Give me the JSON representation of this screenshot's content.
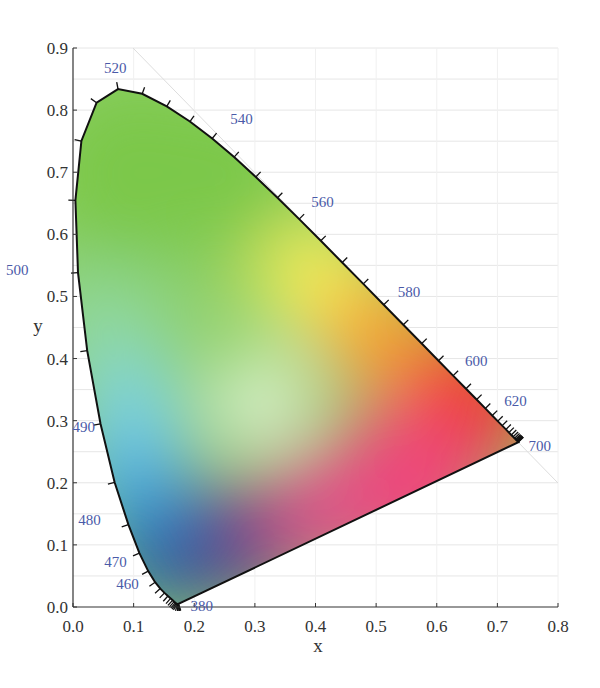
{
  "chart_data": {
    "type": "scatter",
    "title": "",
    "subtitle": "",
    "xlabel": "x",
    "ylabel": "y",
    "xlim": [
      0.0,
      0.8
    ],
    "ylim": [
      0.0,
      0.9
    ],
    "x_ticks": [
      "0.0",
      "0.1",
      "0.2",
      "0.3",
      "0.4",
      "0.5",
      "0.6",
      "0.7",
      "0.8"
    ],
    "y_ticks": [
      "0.0",
      "0.1",
      "0.2",
      "0.3",
      "0.4",
      "0.5",
      "0.6",
      "0.7",
      "0.8",
      "0.9"
    ],
    "grid": true,
    "legend": "none",
    "wavelength_labels": [
      {
        "nm": "380",
        "x": 0.1741,
        "y": 0.005
      },
      {
        "nm": "460",
        "x": 0.144,
        "y": 0.0297
      },
      {
        "nm": "470",
        "x": 0.1241,
        "y": 0.0578
      },
      {
        "nm": "480",
        "x": 0.0913,
        "y": 0.1327
      },
      {
        "nm": "490",
        "x": 0.0454,
        "y": 0.295
      },
      {
        "nm": "500",
        "x": 0.0082,
        "y": 0.5384
      },
      {
        "nm": "520",
        "x": 0.0743,
        "y": 0.8338
      },
      {
        "nm": "540",
        "x": 0.2296,
        "y": 0.7543
      },
      {
        "nm": "560",
        "x": 0.3731,
        "y": 0.6245
      },
      {
        "nm": "580",
        "x": 0.5125,
        "y": 0.4866
      },
      {
        "nm": "600",
        "x": 0.627,
        "y": 0.3725
      },
      {
        "nm": "620",
        "x": 0.6915,
        "y": 0.3083
      },
      {
        "nm": "700",
        "x": 0.7347,
        "y": 0.2653
      }
    ],
    "spectral_locus": [
      [
        0.1741,
        0.005
      ],
      [
        0.174,
        0.005
      ],
      [
        0.1738,
        0.0049
      ],
      [
        0.1736,
        0.0049
      ],
      [
        0.1733,
        0.0048
      ],
      [
        0.173,
        0.0048
      ],
      [
        0.1726,
        0.0048
      ],
      [
        0.1721,
        0.0048
      ],
      [
        0.1714,
        0.0051
      ],
      [
        0.1703,
        0.0058
      ],
      [
        0.1689,
        0.0069
      ],
      [
        0.1669,
        0.0086
      ],
      [
        0.1644,
        0.0109
      ],
      [
        0.1611,
        0.0138
      ],
      [
        0.1566,
        0.0177
      ],
      [
        0.151,
        0.0227
      ],
      [
        0.144,
        0.0297
      ],
      [
        0.1355,
        0.0399
      ],
      [
        0.1241,
        0.0578
      ],
      [
        0.1096,
        0.0868
      ],
      [
        0.0913,
        0.1327
      ],
      [
        0.0687,
        0.2007
      ],
      [
        0.0454,
        0.295
      ],
      [
        0.0235,
        0.4127
      ],
      [
        0.0082,
        0.5384
      ],
      [
        0.0039,
        0.6548
      ],
      [
        0.0139,
        0.7502
      ],
      [
        0.0389,
        0.812
      ],
      [
        0.0743,
        0.8338
      ],
      [
        0.1142,
        0.8262
      ],
      [
        0.1547,
        0.8059
      ],
      [
        0.1929,
        0.7816
      ],
      [
        0.2296,
        0.7543
      ],
      [
        0.2658,
        0.7243
      ],
      [
        0.3016,
        0.6923
      ],
      [
        0.3373,
        0.6589
      ],
      [
        0.3731,
        0.6245
      ],
      [
        0.4087,
        0.5896
      ],
      [
        0.4441,
        0.5547
      ],
      [
        0.4788,
        0.5202
      ],
      [
        0.5125,
        0.4866
      ],
      [
        0.5448,
        0.4544
      ],
      [
        0.5752,
        0.4242
      ],
      [
        0.6029,
        0.3965
      ],
      [
        0.627,
        0.3725
      ],
      [
        0.6482,
        0.3514
      ],
      [
        0.6658,
        0.334
      ],
      [
        0.6801,
        0.3197
      ],
      [
        0.6915,
        0.3083
      ],
      [
        0.7006,
        0.2993
      ],
      [
        0.7079,
        0.292
      ],
      [
        0.714,
        0.2859
      ],
      [
        0.719,
        0.2809
      ],
      [
        0.723,
        0.277
      ],
      [
        0.726,
        0.274
      ],
      [
        0.7283,
        0.2717
      ],
      [
        0.73,
        0.27
      ],
      [
        0.7311,
        0.2689
      ],
      [
        0.732,
        0.268
      ],
      [
        0.7327,
        0.2673
      ],
      [
        0.7334,
        0.2666
      ],
      [
        0.734,
        0.266
      ],
      [
        0.7344,
        0.2656
      ],
      [
        0.7346,
        0.2654
      ],
      [
        0.7347,
        0.2653
      ]
    ],
    "white_point": {
      "x": 0.3127,
      "y": 0.329
    },
    "colors": {
      "green": "#7cc84a",
      "yellow": "#fff25a",
      "red": "#f23a1e",
      "magenta": "#f0457a",
      "blue": "#1e5aa8",
      "violet": "#5a3c8c",
      "cyan": "#7ad2ee",
      "label": "#4a5aa8",
      "outline": "#111111"
    }
  }
}
